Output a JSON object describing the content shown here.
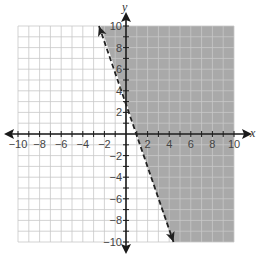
{
  "chart_data": {
    "type": "inequality-graph",
    "title": "",
    "xlabel": "x",
    "ylabel": "y",
    "xlim": [
      -10,
      10
    ],
    "ylim": [
      -10,
      10
    ],
    "grid": true,
    "grid_step": 1,
    "x_tick_labels": [
      "-10",
      "-8",
      "-6",
      "-4",
      "-2",
      "2",
      "4",
      "6",
      "8",
      "10"
    ],
    "y_tick_labels": [
      "10",
      "8",
      "6",
      "4",
      "2",
      "-2",
      "-4",
      "-6",
      "-8",
      "-10"
    ],
    "boundary_line": {
      "equation": "y = -3x + 3",
      "slope": -3,
      "y_intercept": 3,
      "x_intercept": 1,
      "style": "dashed",
      "drawn_from": [
        -2.5,
        10
      ],
      "drawn_to": [
        4.4,
        -10
      ],
      "arrows": "both ends"
    },
    "shaded_region": "right of line (above)",
    "inequality": "y > -3x + 3",
    "colors": {
      "shade": "#a9a9a9",
      "grid": "#c8c8c8",
      "axes": "#1a1a1a",
      "line": "#222222"
    }
  }
}
